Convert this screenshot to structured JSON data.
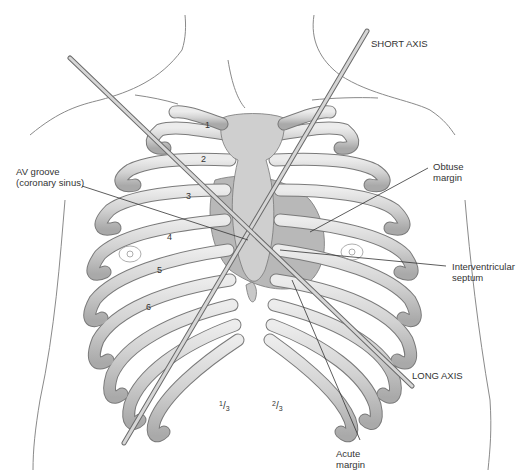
{
  "diagram": {
    "axes": [
      {
        "id": "short",
        "label": "SHORT AXIS"
      },
      {
        "id": "long",
        "label": "LONG AXIS"
      }
    ],
    "labels": {
      "av_groove_line1": "AV groove",
      "av_groove_line2": "(coronary sinus)",
      "obtuse_line1": "Obtuse",
      "obtuse_line2": "margin",
      "septum_line1": "Interventricular",
      "septum_line2": "septum",
      "acute_line1": "Acute",
      "acute_line2": "margin"
    },
    "rib_numbers": [
      "1",
      "2",
      "3",
      "4",
      "5",
      "6"
    ],
    "fractions": [
      {
        "num": "1",
        "den": "3"
      },
      {
        "num": "2",
        "den": "3"
      }
    ],
    "colors": {
      "bone": "#d9d9d9",
      "bone_shade": "#a8a8a8",
      "outline": "#6e6e6e",
      "heart": "#b5b5b5",
      "rod": "#cfcfcf",
      "text": "#333333"
    }
  }
}
